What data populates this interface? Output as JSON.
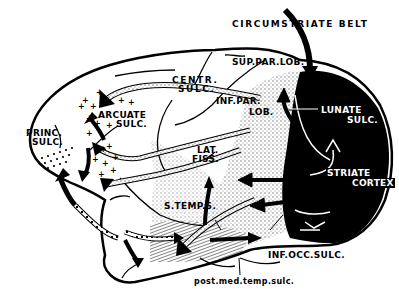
{
  "figure": {
    "type": "lateral brain diagram with cortical projection arrows",
    "colors": {
      "outline": "#000000",
      "background": "#ffffff",
      "striate_fill": "#000000",
      "stipple": "#9a9a9a",
      "hatch": "#555555"
    }
  },
  "labels": {
    "circumstriate_belt": "CIRCUMSTRIATE BELT",
    "sup_par_lob": "SUP.PAR.LOB.",
    "centr_sulc_1": "CENTR.",
    "centr_sulc_2": "SULC.",
    "inf_par_lob_1": "INF.PAR.",
    "inf_par_lob_2": "LOB.",
    "arcuate_sulc_1": "ARCUATE",
    "arcuate_sulc_2": "SULC.",
    "princ_sulc_1": "PRINC.",
    "princ_sulc_2": "SULC.",
    "lunate_sulc_1": "LUNATE",
    "lunate_sulc_2": "SULC.",
    "lat_fiss_1": "LAT.",
    "lat_fiss_2": "FISS.",
    "striate_cortex_1": "STRIATE",
    "striate_cortex_2": "CORTEX",
    "s_temp_s": "S.TEMP.S.",
    "inf_occ_sulc": "INF.OCC.SULC.",
    "post_med_temp_sulc": "post.med.temp.sulc."
  }
}
